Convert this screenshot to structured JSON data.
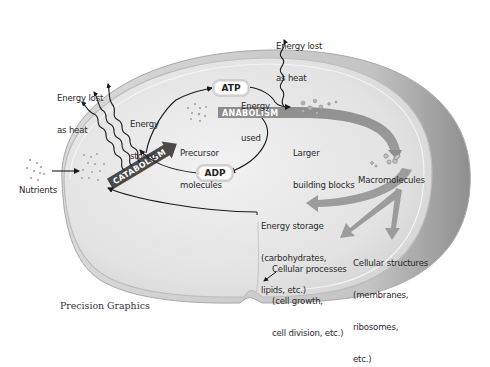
{
  "diagram": {
    "credit": "Precision Graphics",
    "colors": {
      "background": "#ffffff",
      "cell_fill": "#e4e4e4",
      "cell_rim": "#b8b8b8",
      "catabolism_bar": "#4a4a4a",
      "anabolism_bar": "#8a8a8a",
      "output_arrows": "#9a9a9a",
      "line": "#1a1a1a"
    },
    "nodes": {
      "nutrients": "Nutrients",
      "heat_left_line1": "Energy lost",
      "heat_left_line2": "as heat",
      "heat_top_line1": "Energy lost",
      "heat_top_line2": "as heat",
      "energy_stored_line1": "Energy",
      "energy_stored_line2": "stored",
      "energy_used_line1": "Energy",
      "energy_used_line2": "used",
      "atp": "ATP",
      "adp": "ADP",
      "catabolism": "CATABOLISM",
      "anabolism": "ANABOLISM",
      "precursor_line1": "Precursor",
      "precursor_line2": "molecules",
      "larger_line1": "Larger",
      "larger_line2": "building blocks",
      "macromolecules": "Macromolecules",
      "storage_line1": "Energy storage",
      "storage_line2": "(carbohydrates,",
      "storage_line3": "lipids, etc.)",
      "processes_line1": "Cellular processes",
      "processes_line2": "(cell growth,",
      "processes_line3": "cell division, etc.)",
      "structures_line1": "Cellular structures",
      "structures_line2": "(membranes,",
      "structures_line3": "ribosomes,",
      "structures_line4": "etc.)"
    },
    "edges": [
      {
        "from": "Nutrients",
        "to": "CATABOLISM"
      },
      {
        "from": "CATABOLISM",
        "to": "Energy lost as heat"
      },
      {
        "from": "CATABOLISM",
        "to": "ATP",
        "label": "Energy stored"
      },
      {
        "from": "ATP",
        "to": "ANABOLISM",
        "label": "Energy used"
      },
      {
        "from": "ANABOLISM",
        "to": "Energy lost as heat"
      },
      {
        "from": "ANABOLISM",
        "to": "ADP"
      },
      {
        "from": "ADP",
        "to": "CATABOLISM"
      },
      {
        "from": "CATABOLISM",
        "to": "Precursor molecules"
      },
      {
        "from": "ANABOLISM",
        "to": "Macromolecules",
        "via": "Larger building blocks"
      },
      {
        "from": "Macromolecules",
        "to": "Energy storage (carbohydrates, lipids, etc.)"
      },
      {
        "from": "Macromolecules",
        "to": "Cellular processes (cell growth, cell division, etc.)"
      },
      {
        "from": "Macromolecules",
        "to": "Cellular structures (membranes, ribosomes, etc.)"
      },
      {
        "from": "Energy storage",
        "to": "CATABOLISM"
      }
    ]
  }
}
